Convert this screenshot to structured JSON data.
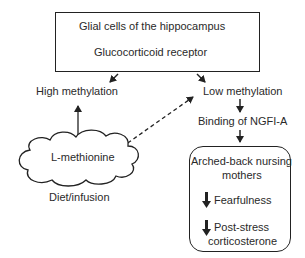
{
  "top_box": {
    "line1": "Glial cells of the hippocampus",
    "line2": "Glucocorticoid receptor"
  },
  "left_branch": {
    "label": "High methylation"
  },
  "right_branch": {
    "label": "Low methylation",
    "next": "Binding of NGFI-A"
  },
  "cloud": {
    "label": "L-methionine",
    "caption": "Diet/infusion"
  },
  "outcome_box": {
    "title_line1": "Arched-back nursing",
    "title_line2": "mothers",
    "effect1": "Fearfulness",
    "effect2_line1": "Post-stress",
    "effect2_line2": "corticosterone",
    "effect_icon": "down-arrow-icon"
  },
  "colors": {
    "stroke": "#222222",
    "text": "#2a2a2a",
    "background": "#ffffff"
  }
}
